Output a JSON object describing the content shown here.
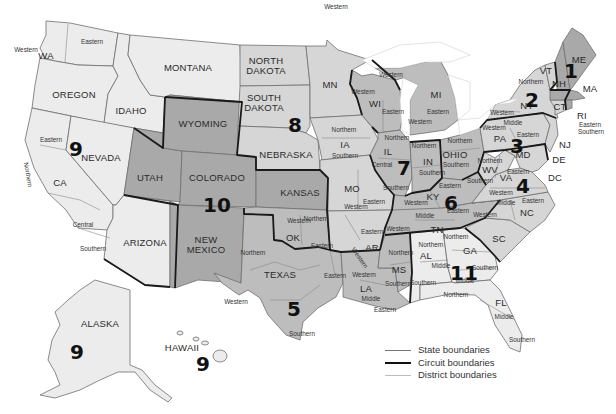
{
  "map": {
    "subject": "U.S. federal judicial circuits and districts",
    "states": [
      {
        "id": "WA",
        "label": "WA",
        "x": 46,
        "y": 56,
        "shade": "c0"
      },
      {
        "id": "OR",
        "label": "OREGON",
        "x": 74,
        "y": 95,
        "shade": "c0"
      },
      {
        "id": "CA",
        "label": "CA",
        "x": 60,
        "y": 183,
        "shade": "c0"
      },
      {
        "id": "NV",
        "label": "NEVADA",
        "x": 101,
        "y": 158,
        "shade": "c0"
      },
      {
        "id": "ID",
        "label": "IDAHO",
        "x": 131,
        "y": 111,
        "shade": "c0"
      },
      {
        "id": "MT",
        "label": "MONTANA",
        "x": 188,
        "y": 68,
        "shade": "c0"
      },
      {
        "id": "WY",
        "label": "WYOMING",
        "x": 203,
        "y": 124,
        "shade": "c3"
      },
      {
        "id": "UT",
        "label": "UTAH",
        "x": 150,
        "y": 178,
        "shade": "c3"
      },
      {
        "id": "CO",
        "label": "COLORADO",
        "x": 217,
        "y": 178,
        "shade": "c3"
      },
      {
        "id": "AZ",
        "label": "ARIZONA",
        "x": 145,
        "y": 243,
        "shade": "c0"
      },
      {
        "id": "NM",
        "label": "NEW MEXICO",
        "x": 206,
        "y": 245,
        "shade": "c3"
      },
      {
        "id": "ND",
        "label": "NORTH DAKOTA",
        "x": 266,
        "y": 66,
        "shade": "c1"
      },
      {
        "id": "SD",
        "label": "SOUTH DAKOTA",
        "x": 264,
        "y": 103,
        "shade": "c1"
      },
      {
        "id": "NE",
        "label": "NEBRASKA",
        "x": 286,
        "y": 155,
        "shade": "c1"
      },
      {
        "id": "KS",
        "label": "KANSAS",
        "x": 300,
        "y": 193,
        "shade": "c3"
      },
      {
        "id": "OK",
        "label": "OK",
        "x": 293,
        "y": 238,
        "shade": "c2"
      },
      {
        "id": "TX",
        "label": "TEXAS",
        "x": 280,
        "y": 275,
        "shade": "c2"
      },
      {
        "id": "MN",
        "label": "MN",
        "x": 330,
        "y": 85,
        "shade": "c1"
      },
      {
        "id": "IA",
        "label": "IA",
        "x": 345,
        "y": 145,
        "shade": "c1"
      },
      {
        "id": "MO",
        "label": "MO",
        "x": 352,
        "y": 189,
        "shade": "c1"
      },
      {
        "id": "AR",
        "label": "AR",
        "x": 372,
        "y": 248,
        "shade": "c1"
      },
      {
        "id": "LA",
        "label": "LA",
        "x": 366,
        "y": 289,
        "shade": "c2"
      },
      {
        "id": "WI",
        "label": "WI",
        "x": 375,
        "y": 104,
        "shade": "c2"
      },
      {
        "id": "IL",
        "label": "IL",
        "x": 388,
        "y": 152,
        "shade": "c2"
      },
      {
        "id": "MI",
        "label": "MI",
        "x": 436,
        "y": 95,
        "shade": "c2"
      },
      {
        "id": "IN",
        "label": "IN",
        "x": 428,
        "y": 162,
        "shade": "c2"
      },
      {
        "id": "OH",
        "label": "OHIO",
        "x": 455,
        "y": 155,
        "shade": "c2"
      },
      {
        "id": "KY",
        "label": "KY",
        "x": 433,
        "y": 197,
        "shade": "c2"
      },
      {
        "id": "TN",
        "label": "TN",
        "x": 437,
        "y": 230,
        "shade": "c2"
      },
      {
        "id": "MS",
        "label": "MS",
        "x": 399,
        "y": 270,
        "shade": "c2"
      },
      {
        "id": "AL",
        "label": "AL",
        "x": 426,
        "y": 256,
        "shade": "c0"
      },
      {
        "id": "GA",
        "label": "GA",
        "x": 470,
        "y": 251,
        "shade": "c0"
      },
      {
        "id": "FL",
        "label": "FL",
        "x": 501,
        "y": 303,
        "shade": "c0"
      },
      {
        "id": "SC",
        "label": "SC",
        "x": 499,
        "y": 239,
        "shade": "c1"
      },
      {
        "id": "NC",
        "label": "NC",
        "x": 527,
        "y": 213,
        "shade": "c1"
      },
      {
        "id": "VA",
        "label": "VA",
        "x": 506,
        "y": 178,
        "shade": "c1"
      },
      {
        "id": "WV",
        "label": "WV",
        "x": 490,
        "y": 170,
        "shade": "c1"
      },
      {
        "id": "MD",
        "label": "MD",
        "x": 523,
        "y": 155,
        "shade": "c1"
      },
      {
        "id": "DE",
        "label": "DE",
        "x": 559,
        "y": 160,
        "shade": "c1"
      },
      {
        "id": "DC",
        "label": "DC",
        "x": 555,
        "y": 178,
        "shade": "c1"
      },
      {
        "id": "PA",
        "label": "PA",
        "x": 500,
        "y": 139,
        "shade": "c1"
      },
      {
        "id": "NJ",
        "label": "NJ",
        "x": 565,
        "y": 145,
        "shade": "c1"
      },
      {
        "id": "NY",
        "label": "NY",
        "x": 527,
        "y": 106,
        "shade": "c1"
      },
      {
        "id": "VT",
        "label": "VT",
        "x": 546,
        "y": 71,
        "shade": "c1"
      },
      {
        "id": "NH",
        "label": "NH",
        "x": 559,
        "y": 84,
        "shade": "c3"
      },
      {
        "id": "ME",
        "label": "ME",
        "x": 579,
        "y": 60,
        "shade": "c3"
      },
      {
        "id": "MA",
        "label": "MA",
        "x": 590,
        "y": 89,
        "shade": "c3"
      },
      {
        "id": "CT",
        "label": "CT",
        "x": 560,
        "y": 107,
        "shade": "c1"
      },
      {
        "id": "RI",
        "label": "RI",
        "x": 582,
        "y": 116,
        "shade": "c3"
      },
      {
        "id": "AK",
        "label": "ALASKA",
        "x": 100,
        "y": 324,
        "shade": "c0"
      },
      {
        "id": "HI",
        "label": "HAWAII",
        "x": 182,
        "y": 348,
        "shade": "c0"
      }
    ],
    "districts": [
      {
        "label": "Western",
        "x": 26,
        "y": 50
      },
      {
        "label": "Eastern",
        "x": 92,
        "y": 42
      },
      {
        "label": "Eastern",
        "x": 51,
        "y": 140
      },
      {
        "label": "Northern",
        "x": 26,
        "y": 173,
        "rotate": 80
      },
      {
        "label": "Central",
        "x": 83,
        "y": 225
      },
      {
        "label": "Southern",
        "x": 93,
        "y": 249
      },
      {
        "label": "Western",
        "x": 336,
        "y": 7
      },
      {
        "label": "Western",
        "x": 391,
        "y": 75
      },
      {
        "label": "Western",
        "x": 363,
        "y": 92
      },
      {
        "label": "Eastern",
        "x": 393,
        "y": 112
      },
      {
        "label": "Eastern",
        "x": 438,
        "y": 112
      },
      {
        "label": "Western",
        "x": 420,
        "y": 122
      },
      {
        "label": "Northern",
        "x": 344,
        "y": 130
      },
      {
        "label": "Southern",
        "x": 345,
        "y": 156
      },
      {
        "label": "Northern",
        "x": 397,
        "y": 138
      },
      {
        "label": "Central",
        "x": 382,
        "y": 165
      },
      {
        "label": "Southern",
        "x": 396,
        "y": 188
      },
      {
        "label": "Northern",
        "x": 424,
        "y": 146
      },
      {
        "label": "Southern",
        "x": 432,
        "y": 173
      },
      {
        "label": "Northern",
        "x": 460,
        "y": 141
      },
      {
        "label": "Southern",
        "x": 456,
        "y": 165
      },
      {
        "label": "Eastern",
        "x": 450,
        "y": 186
      },
      {
        "label": "Western",
        "x": 416,
        "y": 203
      },
      {
        "label": "Eastern",
        "x": 374,
        "y": 202
      },
      {
        "label": "Western",
        "x": 356,
        "y": 207
      },
      {
        "label": "Northern",
        "x": 316,
        "y": 219
      },
      {
        "label": "Western",
        "x": 299,
        "y": 221
      },
      {
        "label": "Eastern",
        "x": 322,
        "y": 246
      },
      {
        "label": "Eastern",
        "x": 372,
        "y": 232
      },
      {
        "label": "Western",
        "x": 358,
        "y": 257,
        "rotate": 55
      },
      {
        "label": "Northern",
        "x": 253,
        "y": 253
      },
      {
        "label": "Western",
        "x": 236,
        "y": 302
      },
      {
        "label": "Eastern",
        "x": 335,
        "y": 276
      },
      {
        "label": "Southern",
        "x": 302,
        "y": 334
      },
      {
        "label": "Western",
        "x": 364,
        "y": 275
      },
      {
        "label": "Middle",
        "x": 371,
        "y": 299
      },
      {
        "label": "Eastern",
        "x": 385,
        "y": 310
      },
      {
        "label": "Northern",
        "x": 401,
        "y": 253
      },
      {
        "label": "Southern",
        "x": 398,
        "y": 284
      },
      {
        "label": "Middle",
        "x": 425,
        "y": 216
      },
      {
        "label": "Eastern",
        "x": 458,
        "y": 211
      },
      {
        "label": "Western",
        "x": 398,
        "y": 229
      },
      {
        "label": "Northern",
        "x": 431,
        "y": 245
      },
      {
        "label": "Middle",
        "x": 441,
        "y": 266
      },
      {
        "label": "Southern",
        "x": 423,
        "y": 283
      },
      {
        "label": "Northern",
        "x": 456,
        "y": 237
      },
      {
        "label": "Middle",
        "x": 465,
        "y": 281
      },
      {
        "label": "Southern",
        "x": 485,
        "y": 268
      },
      {
        "label": "Northern",
        "x": 456,
        "y": 295
      },
      {
        "label": "Middle",
        "x": 504,
        "y": 317
      },
      {
        "label": "Southern",
        "x": 522,
        "y": 340
      },
      {
        "label": "Western",
        "x": 485,
        "y": 215
      },
      {
        "label": "Middle",
        "x": 506,
        "y": 203
      },
      {
        "label": "Eastern",
        "x": 533,
        "y": 201
      },
      {
        "label": "Western",
        "x": 501,
        "y": 193
      },
      {
        "label": "Eastern",
        "x": 518,
        "y": 172
      },
      {
        "label": "Southern",
        "x": 480,
        "y": 181
      },
      {
        "label": "Northern",
        "x": 490,
        "y": 161
      },
      {
        "label": "Western",
        "x": 494,
        "y": 128
      },
      {
        "label": "Middle",
        "x": 513,
        "y": 123
      },
      {
        "label": "Eastern",
        "x": 528,
        "y": 135
      },
      {
        "label": "Western",
        "x": 502,
        "y": 113
      },
      {
        "label": "Northern",
        "x": 531,
        "y": 82
      },
      {
        "label": "Eastern",
        "x": 590,
        "y": 125
      },
      {
        "label": "Southern",
        "x": 591,
        "y": 132
      }
    ],
    "circuits": [
      {
        "number": "1",
        "x": 571,
        "y": 71
      },
      {
        "number": "2",
        "x": 532,
        "y": 100
      },
      {
        "number": "3",
        "x": 517,
        "y": 146
      },
      {
        "number": "4",
        "x": 523,
        "y": 186
      },
      {
        "number": "5",
        "x": 294,
        "y": 309
      },
      {
        "number": "6",
        "x": 451,
        "y": 203
      },
      {
        "number": "7",
        "x": 404,
        "y": 168
      },
      {
        "number": "8",
        "x": 295,
        "y": 125
      },
      {
        "number": "9",
        "x": 76,
        "y": 149
      },
      {
        "number": "9",
        "x": 77,
        "y": 352
      },
      {
        "number": "9",
        "x": 203,
        "y": 364
      },
      {
        "number": "10",
        "x": 217,
        "y": 205
      },
      {
        "number": "11",
        "x": 464,
        "y": 273
      }
    ]
  },
  "legend": {
    "items": [
      {
        "label": "State boundaries",
        "style": "state"
      },
      {
        "label": "Circuit boundaries",
        "style": "circuit"
      },
      {
        "label": "District boundaries",
        "style": "district"
      }
    ]
  },
  "colors": {
    "background": "#ffffff",
    "light_fill": "#ececec",
    "medium_fill": "#d6d6d6",
    "mid_dark_fill": "#bdbdbd",
    "dark_fill": "#a9a9a9",
    "circuit_line": "#1a1a1a",
    "state_line": "#6e6e6e"
  }
}
